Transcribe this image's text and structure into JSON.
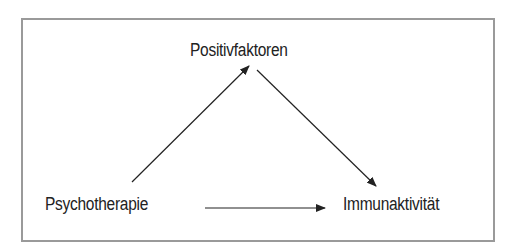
{
  "diagram": {
    "nodes": [
      {
        "id": "positivfaktoren",
        "label": "Positivfaktoren"
      },
      {
        "id": "psychotherapie",
        "label": "Psychotherapie"
      },
      {
        "id": "immunaktivitaet",
        "label": "Immunaktivität"
      }
    ],
    "edges": [
      {
        "from": "psychotherapie",
        "to": "positivfaktoren"
      },
      {
        "from": "positivfaktoren",
        "to": "immunaktivitaet"
      },
      {
        "from": "psychotherapie",
        "to": "immunaktivitaet"
      }
    ],
    "colors": {
      "border": "#9a9a9a",
      "text": "#222222",
      "arrow": "#222222"
    }
  }
}
